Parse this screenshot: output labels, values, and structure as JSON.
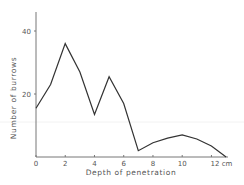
{
  "chart_data": {
    "type": "line",
    "title": "",
    "xlabel": "Depth of penetration",
    "ylabel": "Number of burrows",
    "x_unit": "cm",
    "x": [
      0,
      1,
      2,
      3,
      4,
      5,
      6,
      7,
      8,
      9,
      10,
      11,
      12,
      13
    ],
    "series": [
      {
        "name": "Number of burrows",
        "values": [
          15.5,
          23,
          36,
          27,
          13.5,
          25.5,
          17,
          2,
          4.5,
          6,
          7,
          5.7,
          3.5,
          0
        ]
      }
    ],
    "x_ticks": [
      0,
      2,
      4,
      6,
      8,
      10,
      12
    ],
    "x_tick_labels": [
      "0",
      "2",
      "4",
      "6",
      "8",
      "10",
      "12 cm"
    ],
    "y_ticks": [
      20,
      40
    ],
    "y_tick_labels": [
      "20",
      "40"
    ],
    "xlim": [
      0,
      13
    ],
    "ylim": [
      0,
      46
    ],
    "grid": false,
    "legend": "none",
    "colors": {
      "line": "#333333",
      "axis": "#666666",
      "text": "#555555"
    }
  }
}
